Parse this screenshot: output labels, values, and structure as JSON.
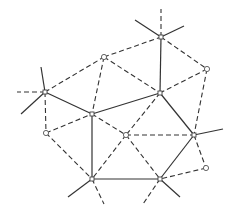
{
  "diagram": {
    "title": "",
    "type": "delaunay-voronoi-dual-graph",
    "nodes": [
      {
        "id": "A",
        "x": 161,
        "y": 37,
        "kind": "star"
      },
      {
        "id": "B",
        "x": 104,
        "y": 57,
        "kind": "circle"
      },
      {
        "id": "C",
        "x": 45,
        "y": 92,
        "kind": "star"
      },
      {
        "id": "D",
        "x": 207,
        "y": 69,
        "kind": "circle"
      },
      {
        "id": "E",
        "x": 160,
        "y": 93,
        "kind": "star"
      },
      {
        "id": "F",
        "x": 92,
        "y": 114,
        "kind": "star"
      },
      {
        "id": "G",
        "x": 46,
        "y": 133,
        "kind": "circle"
      },
      {
        "id": "H",
        "x": 126,
        "y": 135,
        "kind": "circle"
      },
      {
        "id": "I",
        "x": 194,
        "y": 135,
        "kind": "star"
      },
      {
        "id": "J",
        "x": 92,
        "y": 179,
        "kind": "star"
      },
      {
        "id": "K",
        "x": 160,
        "y": 179,
        "kind": "star"
      },
      {
        "id": "L",
        "x": 206,
        "y": 168,
        "kind": "circle"
      }
    ],
    "solid_edges": [
      [
        "C",
        "F"
      ],
      [
        "F",
        "E"
      ],
      [
        "A",
        "E"
      ],
      [
        "E",
        "I"
      ],
      [
        "I",
        "K"
      ],
      [
        "K",
        "J"
      ],
      [
        "J",
        "F"
      ]
    ],
    "dashed_edges": [
      [
        "C",
        "B"
      ],
      [
        "B",
        "A"
      ],
      [
        "A",
        "D"
      ],
      [
        "B",
        "F"
      ],
      [
        "B",
        "E"
      ],
      [
        "D",
        "E"
      ],
      [
        "D",
        "I"
      ],
      [
        "C",
        "G"
      ],
      [
        "G",
        "F"
      ],
      [
        "G",
        "J"
      ],
      [
        "F",
        "H"
      ],
      [
        "E",
        "H"
      ],
      [
        "H",
        "I"
      ],
      [
        "H",
        "J"
      ],
      [
        "H",
        "K"
      ],
      [
        "I",
        "L"
      ],
      [
        "L",
        "K"
      ]
    ],
    "solid_rays": [
      {
        "from": "A",
        "to": [
          135,
          20
        ]
      },
      {
        "from": "A",
        "to": [
          184,
          26
        ]
      },
      {
        "from": "C",
        "to": [
          41,
          67
        ]
      },
      {
        "from": "C",
        "to": [
          21,
          114
        ]
      },
      {
        "from": "I",
        "to": [
          223,
          129
        ]
      },
      {
        "from": "J",
        "to": [
          68,
          197
        ]
      },
      {
        "from": "K",
        "to": [
          180,
          197
        ]
      }
    ],
    "dashed_rays": [
      {
        "from": "A",
        "to": [
          161,
          9
        ]
      },
      {
        "from": "C",
        "to": [
          17,
          92
        ]
      },
      {
        "from": "J",
        "to": [
          104,
          204
        ]
      },
      {
        "from": "K",
        "to": [
          143,
          204
        ]
      }
    ]
  }
}
